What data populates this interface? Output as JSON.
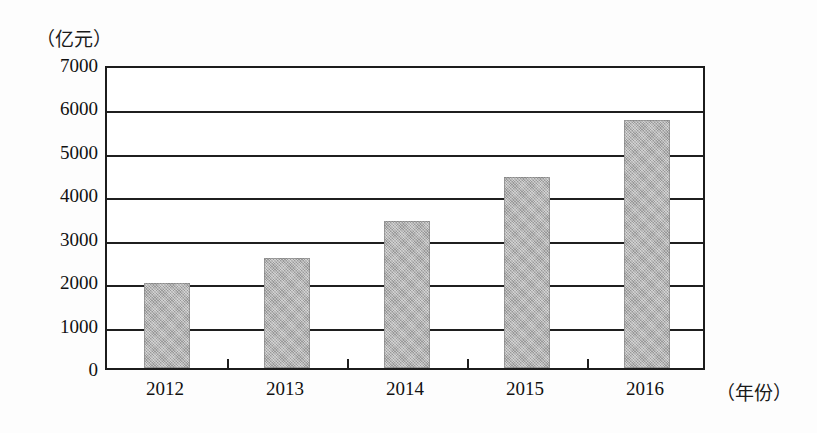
{
  "chart_data": {
    "type": "bar",
    "title": "",
    "xlabel": "（年份）",
    "ylabel": "（亿元）",
    "categories": [
      "2012",
      "2013",
      "2014",
      "2015",
      "2016"
    ],
    "values": [
      1950,
      2530,
      3380,
      4400,
      5700
    ],
    "ylim": [
      0,
      7000
    ],
    "y_ticks": [
      7000,
      6000,
      5000,
      4000,
      3000,
      2000,
      1000,
      0
    ],
    "y_tick_labels": [
      "7000",
      "6000",
      "5000",
      "4000",
      "3000",
      "2000",
      "1000",
      "0"
    ],
    "grid": true,
    "grid_axis": "y",
    "legend": false,
    "bar_color": "#ababab",
    "axis_color": "#1f1f1f",
    "series": [
      {
        "name": "",
        "values": [
          1950,
          2530,
          3380,
          4400,
          5700
        ]
      }
    ]
  },
  "axes": {
    "y_unit_caption": "（亿元）",
    "x_unit_caption": "（年份）"
  }
}
